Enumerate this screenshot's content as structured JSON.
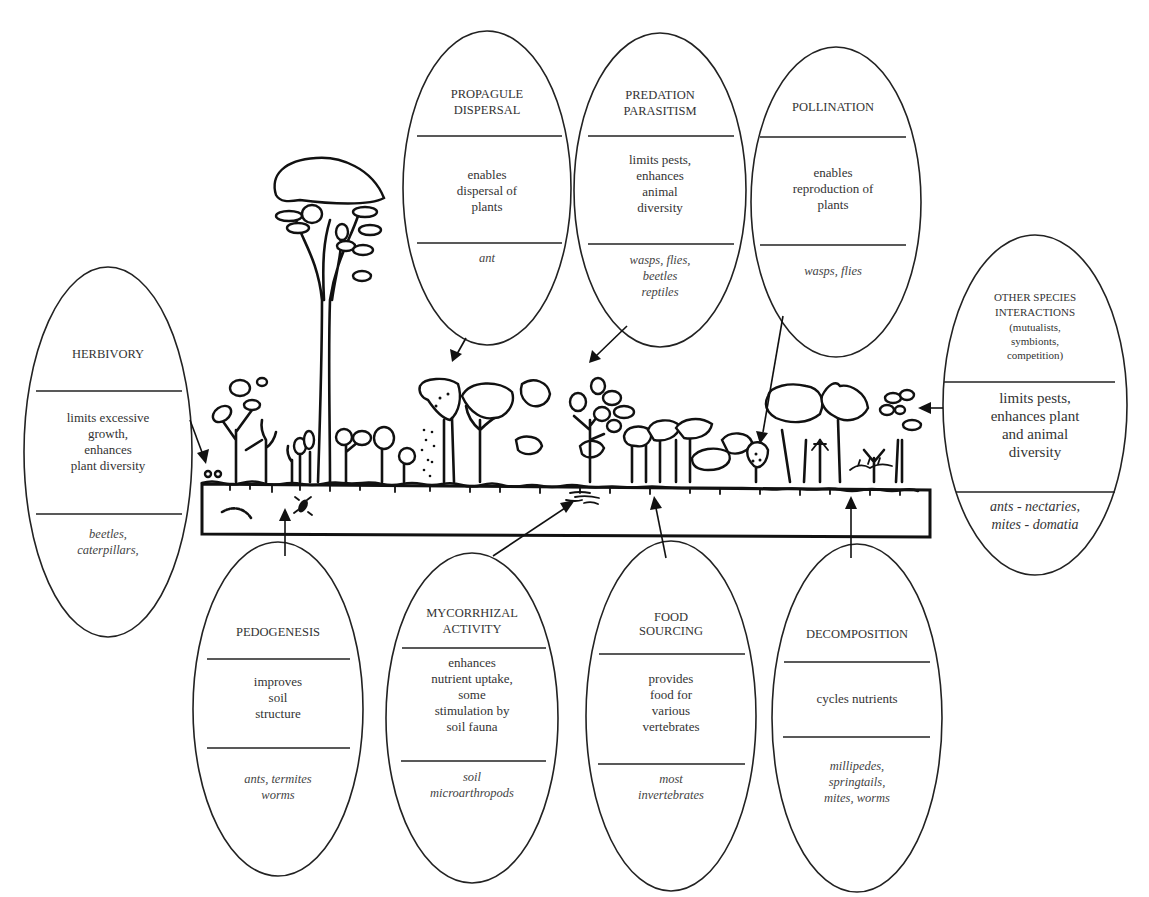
{
  "diagram": {
    "central_scene": "vegetation-and-soil-illustration",
    "ellipses": [
      {
        "id": "herbivory",
        "title": [
          "HERBIVORY"
        ],
        "function": [
          "limits excessive",
          "growth,",
          "enhances",
          "plant diversity"
        ],
        "organisms": [
          "beetles,",
          "caterpillars,"
        ]
      },
      {
        "id": "propagule-dispersal",
        "title": [
          "PROPAGULE",
          "DISPERSAL"
        ],
        "function": [
          "enables",
          "dispersal of",
          "plants"
        ],
        "organisms": [
          "ant"
        ]
      },
      {
        "id": "predation-parasitism",
        "title": [
          "PREDATION",
          "PARASITISM"
        ],
        "function": [
          "limits pests,",
          "enhances",
          "animal",
          "diversity"
        ],
        "organisms": [
          "wasps, flies,",
          "beetles",
          "reptiles"
        ]
      },
      {
        "id": "pollination",
        "title": [
          "POLLINATION"
        ],
        "function": [
          "enables",
          "reproduction of",
          "plants"
        ],
        "organisms": [
          "wasps, flies"
        ]
      },
      {
        "id": "other-species-interactions",
        "title": [
          "OTHER SPECIES",
          "INTERACTIONS"
        ],
        "subtitle": [
          "(mutualists,",
          "symbionts,",
          "competition)"
        ],
        "function": [
          "limits pests,",
          "enhances plant",
          "and animal",
          "diversity"
        ],
        "organisms": [
          "ants - nectaries,",
          "mites - domatia"
        ]
      },
      {
        "id": "pedogenesis",
        "title": [
          "PEDOGENESIS"
        ],
        "function": [
          "improves",
          "soil",
          "structure"
        ],
        "organisms": [
          "ants, termites",
          "worms"
        ]
      },
      {
        "id": "mycorrhizal-activity",
        "title": [
          "MYCORRHIZAL",
          "ACTIVITY"
        ],
        "function": [
          "enhances",
          "nutrient uptake,",
          "some",
          "stimulation by",
          "soil fauna"
        ],
        "organisms": [
          "soil",
          "microarthropods"
        ]
      },
      {
        "id": "food-sourcing",
        "title": [
          "FOOD",
          "SOURCING"
        ],
        "function": [
          "provides",
          "food for",
          "various",
          "vertebrates"
        ],
        "organisms": [
          "most",
          "invertebrates"
        ]
      },
      {
        "id": "decomposition",
        "title": [
          "DECOMPOSITION"
        ],
        "function": [
          "cycles nutrients"
        ],
        "organisms": [
          "millipedes,",
          "springtails,",
          "mites, worms"
        ]
      }
    ]
  }
}
